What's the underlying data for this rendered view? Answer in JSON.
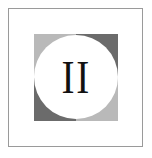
{
  "emblem": {
    "numeral": "II",
    "colors": {
      "light_gray": "#b9b9b9",
      "dark_gray": "#6b6b6b",
      "circle_fill": "#ffffff",
      "numeral": "#111111",
      "frame_border": "#9a9a9a"
    },
    "quadrants": {
      "top_left": "light-gray",
      "top_right": "dark-gray",
      "bottom_left": "dark-gray",
      "bottom_right": "light-gray"
    }
  }
}
